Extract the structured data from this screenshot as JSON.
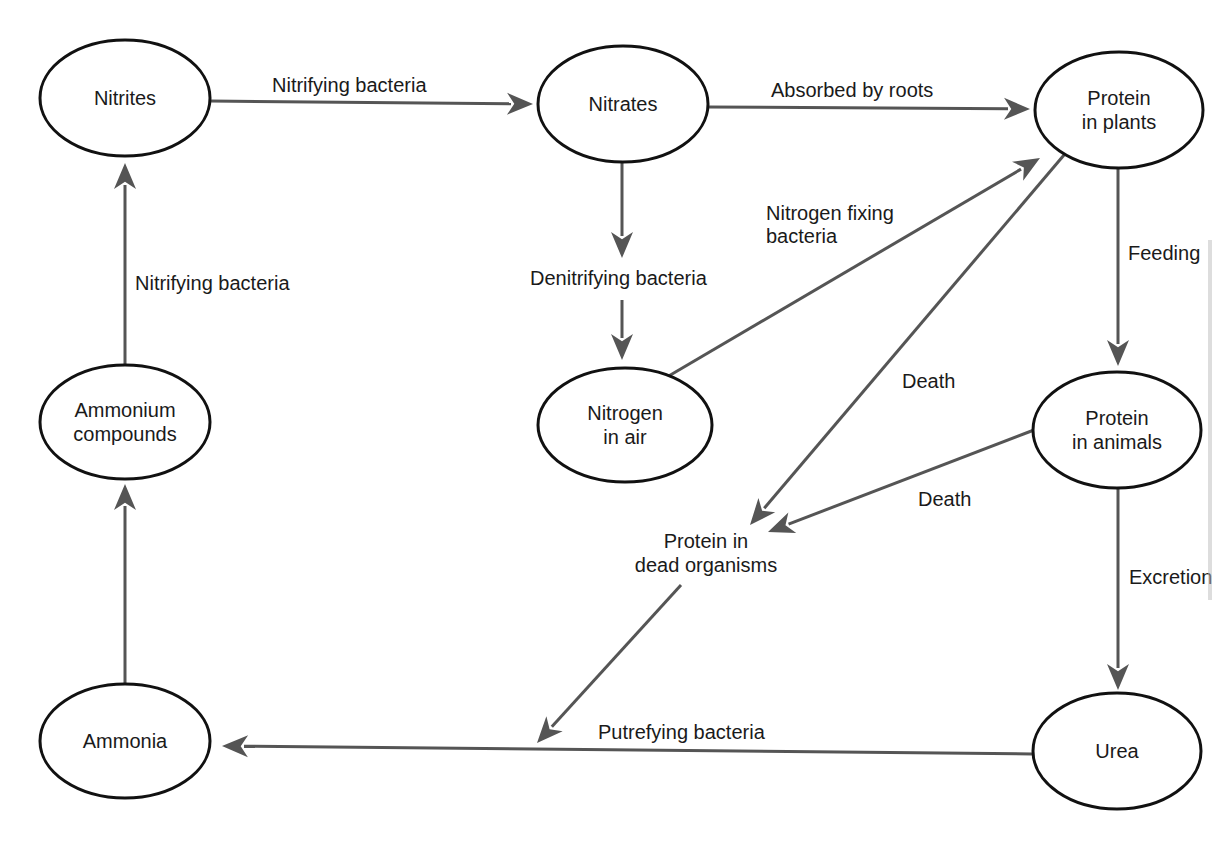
{
  "diagram": {
    "colors": {
      "node_stroke": "#111111",
      "arrow": "#555555",
      "text": "#1a1a1a",
      "background": "#ffffff"
    },
    "nodes": [
      {
        "id": "nitrites",
        "lines": [
          "Nitrites"
        ],
        "cx": 125,
        "cy": 98,
        "rx": 85,
        "ry": 58
      },
      {
        "id": "nitrates",
        "lines": [
          "Nitrates"
        ],
        "cx": 623,
        "cy": 104,
        "rx": 85,
        "ry": 58
      },
      {
        "id": "protein-in-plants",
        "lines": [
          "Protein",
          "in plants"
        ],
        "cx": 1119,
        "cy": 110,
        "rx": 84,
        "ry": 58
      },
      {
        "id": "ammonium-compounds",
        "lines": [
          "Ammonium",
          "compounds"
        ],
        "cx": 125,
        "cy": 422,
        "rx": 85,
        "ry": 57
      },
      {
        "id": "nitrogen-in-air",
        "lines": [
          "Nitrogen",
          "in air"
        ],
        "cx": 625,
        "cy": 425,
        "rx": 87,
        "ry": 57
      },
      {
        "id": "protein-in-animals",
        "lines": [
          "Protein",
          "in animals"
        ],
        "cx": 1117,
        "cy": 430,
        "rx": 84,
        "ry": 58
      },
      {
        "id": "ammonia",
        "lines": [
          "Ammonia"
        ],
        "cx": 125,
        "cy": 741,
        "rx": 85,
        "ry": 57
      },
      {
        "id": "urea",
        "lines": [
          "Urea"
        ],
        "cx": 1117,
        "cy": 751,
        "rx": 84,
        "ry": 58
      }
    ],
    "free_labels": [
      {
        "id": "protein-in-dead-organisms",
        "lines": [
          "Protein in",
          "dead organisms"
        ],
        "x": 706,
        "y": 548
      }
    ],
    "edges": [
      {
        "id": "nitrites-to-nitrates",
        "label": "Nitrifying bacteria",
        "points": [
          [
            210,
            101
          ],
          [
            533,
            104
          ]
        ],
        "label_x": 272,
        "label_y": 92
      },
      {
        "id": "nitrates-to-protein-in-plants",
        "label": "Absorbed by roots",
        "points": [
          [
            708,
            107
          ],
          [
            1030,
            109
          ]
        ],
        "label_x": 771,
        "label_y": 97
      },
      {
        "id": "nitrates-to-denitrifying",
        "label": "",
        "points": [
          [
            622,
            162
          ],
          [
            622,
            258
          ]
        ],
        "label_x": 0,
        "label_y": 0
      },
      {
        "id": "denitrifying-to-nitrogen-in-air",
        "label": "Denitrifying bacteria",
        "points": [
          [
            622,
            300
          ],
          [
            622,
            360
          ]
        ],
        "label_x": 530,
        "label_y": 285
      },
      {
        "id": "nitrogen-in-air-to-protein-in-plants",
        "label": "Nitrogen fixing",
        "label2": "bacteria",
        "points": [
          [
            667,
            377
          ],
          [
            1040,
            158
          ]
        ],
        "label_x": 766,
        "label_y": 220
      },
      {
        "id": "protein-in-plants-to-dead",
        "label": "Death",
        "points": [
          [
            1064,
            155
          ],
          [
            750,
            525
          ]
        ],
        "label_x": 902,
        "label_y": 388
      },
      {
        "id": "protein-in-plants-to-protein-in-animals",
        "label": "Feeding",
        "points": [
          [
            1118,
            168
          ],
          [
            1118,
            366
          ]
        ],
        "label_x": 1128,
        "label_y": 260
      },
      {
        "id": "protein-in-animals-to-dead",
        "label": "Death",
        "points": [
          [
            1034,
            430
          ],
          [
            768,
            532
          ]
        ],
        "label_x": 918,
        "label_y": 506
      },
      {
        "id": "protein-in-animals-to-urea",
        "label": "Excretion",
        "points": [
          [
            1118,
            488
          ],
          [
            1118,
            690
          ]
        ],
        "label_x": 1129,
        "label_y": 584
      },
      {
        "id": "dead-to-ammonia-path",
        "label": "",
        "points": [
          [
            681,
            585
          ],
          [
            537,
            743
          ]
        ],
        "label_x": 0,
        "label_y": 0
      },
      {
        "id": "urea-to-ammonia",
        "label": "Putrefying bacteria",
        "points": [
          [
            1032,
            754
          ],
          [
            222,
            746
          ]
        ],
        "label_x": 598,
        "label_y": 739
      },
      {
        "id": "ammonium-to-nitrites",
        "label": "Nitrifying bacteria",
        "points": [
          [
            125,
            364
          ],
          [
            125,
            163
          ]
        ],
        "label_x": 135,
        "label_y": 290
      },
      {
        "id": "ammonia-to-ammonium",
        "label": "",
        "points": [
          [
            125,
            685
          ],
          [
            125,
            484
          ]
        ],
        "label_x": 0,
        "label_y": 0
      }
    ]
  }
}
